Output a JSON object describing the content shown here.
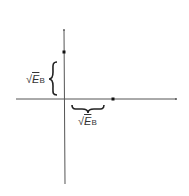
{
  "diagram": {
    "type": "constellation-axes",
    "axes": {
      "horizontal": "in-phase",
      "vertical": "quadrature"
    },
    "points": [
      {
        "name": "point-on-vertical-axis",
        "x": 64,
        "y": 52
      },
      {
        "name": "point-on-horizontal-axis",
        "x": 113,
        "y": 99
      }
    ],
    "labels": {
      "vertical_distance": {
        "radical": "√",
        "symbol": "E",
        "subscript": "B"
      },
      "horizontal_distance": {
        "radical": "√",
        "symbol": "E",
        "subscript": "B"
      }
    },
    "colors": {
      "line": "#555555",
      "point": "#111111",
      "text": "#333333"
    }
  }
}
